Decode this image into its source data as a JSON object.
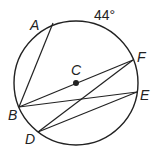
{
  "diagram": {
    "type": "circle-geometry",
    "circle": {
      "center_label": "C",
      "cx": 76,
      "cy": 83,
      "r": 62
    },
    "points": {
      "A": {
        "label": "A",
        "x": 53,
        "y": 23
      },
      "F": {
        "label": "F",
        "x": 133,
        "y": 60
      },
      "E": {
        "label": "E",
        "x": 137,
        "y": 92
      },
      "B": {
        "label": "B",
        "x": 19,
        "y": 107
      },
      "D": {
        "label": "D",
        "x": 38,
        "y": 132
      },
      "C": {
        "label": "C",
        "x": 76,
        "y": 83
      }
    },
    "segments": [
      "AB",
      "BF",
      "BE",
      "DF",
      "DE"
    ],
    "arc_label": {
      "text": "44°",
      "arc": "AF"
    },
    "colors": {
      "stroke": "#222222",
      "background": "#ffffff"
    }
  }
}
